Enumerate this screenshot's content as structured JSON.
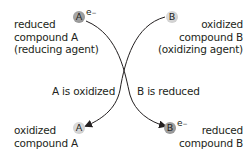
{
  "diagram": {
    "top_left": {
      "lines": [
        "reduced",
        "compound A",
        "(reducing agent)"
      ],
      "circle": "A",
      "electron": "e",
      "electron_sup": "−"
    },
    "top_right": {
      "lines": [
        "oxidized",
        "compound B",
        "(oxidizing agent)"
      ],
      "circle": "B"
    },
    "middle_left": "A is oxidized",
    "middle_right": "B is reduced",
    "bottom_left": {
      "lines": [
        "oxidized",
        "compound A"
      ],
      "circle": "A"
    },
    "bottom_right": {
      "lines": [
        "reduced",
        "compound B"
      ],
      "circle": "B",
      "electron": "e",
      "electron_sup": "−"
    },
    "colors": {
      "circle_dark": "#999999",
      "circle_light": "#d4d4d4",
      "text": "#231f20",
      "arrow": "#231f20"
    }
  }
}
